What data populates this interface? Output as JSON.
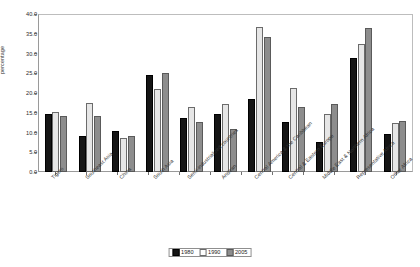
{
  "chart_data": {
    "type": "bar",
    "title": "",
    "xlabel": "",
    "ylabel": "percentage",
    "ylim": [
      0.0,
      40.0
    ],
    "ytick_step": 5.0,
    "ytick_labels": [
      "0.0",
      "5.0",
      "10.0",
      "15.0",
      "20.0",
      "25.0",
      "30.0",
      "35.0",
      "40.0"
    ],
    "grid": false,
    "legend_position": "bottom-center",
    "categories": [
      "Tigers",
      "Southeast Asia",
      "China",
      "South Asia",
      "Semi-industrialized countries",
      "Andean",
      "Central America & the Caribbean",
      "Central & Eastern Europe",
      "Middle East & Northern Africa",
      "Representative Africa",
      "Other Africa"
    ],
    "series": [
      {
        "name": "1980",
        "color": "#151515",
        "values": [
          14.6,
          9.2,
          10.3,
          24.6,
          13.7,
          14.8,
          18.5,
          12.6,
          7.7,
          28.8,
          9.5
        ]
      },
      {
        "name": "1990",
        "color": "#e6e6e6",
        "values": [
          15.3,
          17.4,
          8.5,
          21.0,
          16.5,
          17.2,
          36.8,
          21.2,
          14.8,
          32.5,
          12.3
        ]
      },
      {
        "name": "2005",
        "color": "#8d8d8d",
        "values": [
          14.2,
          14.2,
          9.0,
          25.0,
          12.7,
          11.0,
          34.2,
          16.4,
          17.2,
          36.5,
          13.0
        ]
      }
    ]
  },
  "legend": {
    "items": [
      {
        "label": "1980"
      },
      {
        "label": "1990"
      },
      {
        "label": "2005"
      }
    ]
  }
}
